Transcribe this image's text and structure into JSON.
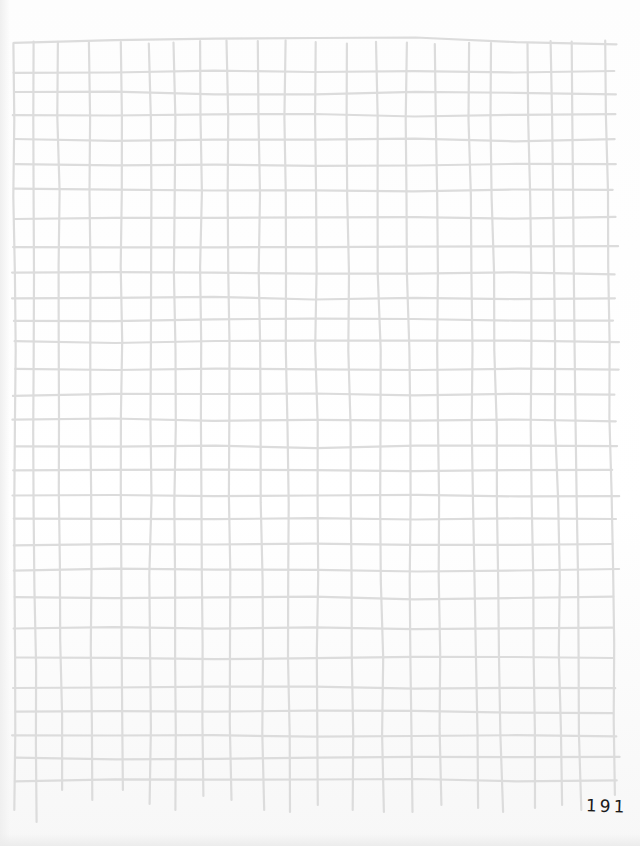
{
  "page": {
    "type": "hand-drawn grid sheet",
    "page_number": "191"
  },
  "style": {
    "line_color": "#dcdcdc",
    "line_width": 2.2,
    "paper_color": "#ffffff",
    "text_color": "#1a1a1a"
  },
  "grid": {
    "top_edge_y": 44,
    "left_x": 14,
    "right_x": 616,
    "vertical_lines_x": [
      14,
      33,
      58,
      90,
      122,
      150,
      174,
      200,
      227,
      258,
      285,
      315,
      346,
      377,
      406,
      436,
      468,
      490,
      528,
      550,
      572,
      606
    ],
    "vertical_lines_bottom_y": [
      810,
      822,
      790,
      800,
      790,
      804,
      810,
      796,
      800,
      810,
      812,
      805,
      810,
      812,
      812,
      805,
      808,
      812,
      808,
      805,
      810,
      795
    ],
    "horizontal_lines_y": [
      44,
      72,
      93,
      115,
      140,
      165,
      190,
      218,
      246,
      273,
      298,
      320,
      342,
      370,
      395,
      420,
      447,
      470,
      495,
      518,
      544,
      570,
      598,
      628,
      658,
      688,
      712,
      736,
      758,
      780
    ]
  }
}
